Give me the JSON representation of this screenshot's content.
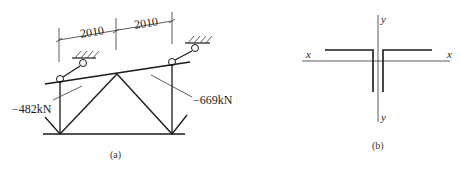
{
  "figure_a": {
    "caption": "(a)",
    "dimensions": [
      {
        "label": "2010"
      },
      {
        "label": "2010"
      }
    ],
    "forces": {
      "left": "−482kN",
      "right": "−669kN"
    }
  },
  "figure_b": {
    "caption": "(b)",
    "axes": {
      "x_left": "x",
      "x_right": "x",
      "y_top": "y",
      "y_bottom": "y"
    }
  },
  "colors": {
    "line": "#1a1a1a",
    "background": "#ffffff"
  }
}
